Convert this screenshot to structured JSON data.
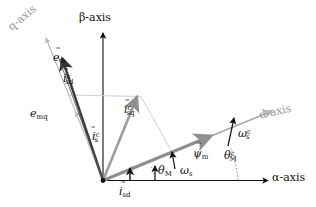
{
  "figure": {
    "kind": "vector-phasor-diagram",
    "title": "",
    "background": "#ffffff",
    "colors": {
      "axis_black": "#111111",
      "gray_axis": "#9a9a9a",
      "gray_vector": "#808080",
      "light_gray": "#c8c8c8",
      "dark_vector": "#333333"
    }
  },
  "axes": [
    {
      "id": "alpha",
      "label": "α-axis",
      "color": "#111111",
      "style": "solid-black"
    },
    {
      "id": "beta",
      "label": "β-axis",
      "color": "#111111",
      "style": "solid-black"
    },
    {
      "id": "d",
      "label": "d-axis",
      "color": "#9a9a9a",
      "style": "solid-gray"
    },
    {
      "id": "q",
      "label": "q-axis",
      "color": "#9a9a9a",
      "style": "solid-gray"
    }
  ],
  "vectors": [
    {
      "id": "e_m",
      "base": "e",
      "sup": "",
      "sub": "m",
      "arrow": true,
      "color": "#333333",
      "label": "e⃗m"
    },
    {
      "id": "e_mq",
      "base": "e",
      "sup": "",
      "sub": "mq",
      "arrow": false,
      "color": "#111111",
      "label": "emq"
    },
    {
      "id": "i_sd_c",
      "base": "i",
      "sup": "c",
      "sub": "sd",
      "arrow": true,
      "color": "#c8c8c8",
      "label": "i⃗csd"
    },
    {
      "id": "i_sq_c",
      "base": "i",
      "sup": "c",
      "sub": "sq",
      "arrow": true,
      "color": "#c8c8c8",
      "label": "i⃗csq"
    },
    {
      "id": "i_s_c",
      "base": "i",
      "sup": "c",
      "sub": "s",
      "arrow": true,
      "color": "#9a9a9a",
      "label": "i⃗cs"
    },
    {
      "id": "i_sd",
      "base": "i",
      "sup": "",
      "sub": "sd",
      "arrow": true,
      "color": "#111111",
      "label": "i⃗sd"
    },
    {
      "id": "psi_m",
      "base": "ψ",
      "sup": "",
      "sub": "m",
      "arrow": true,
      "color": "#808080",
      "label": "ψ⃗m"
    }
  ],
  "angles": [
    {
      "id": "theta_M",
      "base": "θ",
      "sup": "",
      "sub": "M",
      "label": "θM"
    },
    {
      "id": "theta_M_c",
      "base": "θ",
      "sup": "c",
      "sub": "M",
      "label": "θcM"
    }
  ],
  "rates": [
    {
      "id": "omega_s",
      "base": "ω",
      "sup": "",
      "sub": "s",
      "label": "ωs"
    },
    {
      "id": "omega_s_c",
      "base": "ω",
      "sup": "c",
      "sub": "s",
      "label": "ωcs"
    }
  ],
  "labels": {
    "alpha_axis": "α-axis",
    "beta_axis": "β-axis",
    "d_axis": "d-axis",
    "q_axis": "q-axis",
    "e_m_base": "e",
    "e_m_sub": "m",
    "e_mq_base": "e",
    "e_mq_sub": "mq",
    "i_base": "i",
    "i_sup_c": "c",
    "i_sub_sd": "sd",
    "i_sub_sq": "sq",
    "i_sub_s": "s",
    "psi_base": "ψ",
    "psi_sub_m": "m",
    "theta_base": "θ",
    "theta_sub_M": "M",
    "theta_sup_c": "c",
    "omega_base": "ω",
    "omega_sub_s": "s",
    "omega_sup_c": "c",
    "vec_accent": "⃗"
  }
}
